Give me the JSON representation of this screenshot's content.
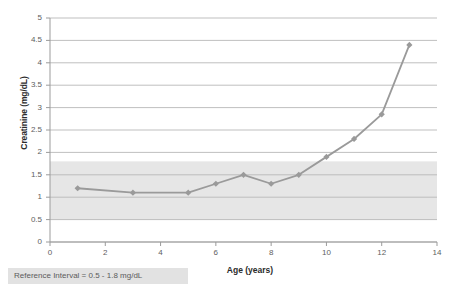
{
  "chart_data": {
    "type": "line",
    "title": "",
    "xlabel": "Age (years)",
    "ylabel": "Creatinine (mg/dL)",
    "x": [
      1,
      3,
      5,
      6,
      7,
      8,
      9,
      10,
      11,
      12,
      13
    ],
    "values": [
      1.2,
      1.1,
      1.1,
      1.3,
      1.5,
      1.3,
      1.5,
      1.9,
      2.3,
      2.85,
      4.4
    ],
    "series": [
      {
        "name": "Creatinine",
        "values": [
          1.2,
          1.1,
          1.1,
          1.3,
          1.5,
          1.3,
          1.5,
          1.9,
          2.3,
          2.85,
          4.4
        ]
      }
    ],
    "xlim": [
      0,
      14
    ],
    "ylim": [
      0,
      5
    ],
    "xticks": [
      0,
      2,
      4,
      6,
      8,
      10,
      12,
      14
    ],
    "xtick_labels": [
      "0",
      "2",
      "4",
      "6",
      "8",
      "10",
      "12",
      "14"
    ],
    "yticks": [
      0,
      0.5,
      1,
      1.5,
      2,
      2.5,
      3,
      3.5,
      4,
      4.5,
      5
    ],
    "ytick_labels": [
      "0",
      "0.5",
      "1",
      "1.5",
      "2",
      "2.5",
      "3",
      "3.5",
      "4",
      "4.5",
      "5"
    ],
    "grid": "horizontal",
    "legend": "none",
    "marker": "diamond",
    "series_color": "#9a9a9a",
    "gridline_color": "#b8b8b8",
    "reference_band": {
      "label": "Reference Interval = 0.5 - 1.8 mg/dL",
      "low": 0.5,
      "high": 1.8,
      "color": "#e6e6e6"
    }
  },
  "caption": {
    "reference_interval": "Reference Interval = 0.5 - 1.8 mg/dL"
  }
}
